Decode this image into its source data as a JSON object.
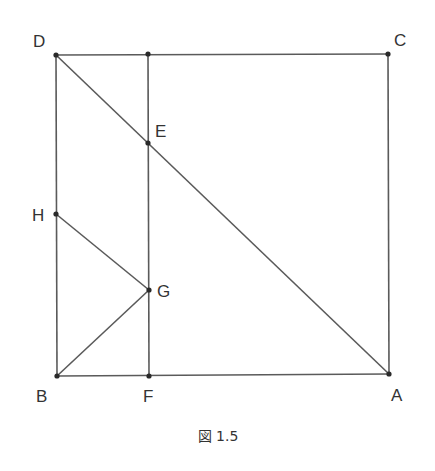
{
  "figure": {
    "caption": "図 1.5",
    "points": {
      "A": {
        "label": "A"
      },
      "B": {
        "label": "B"
      },
      "C": {
        "label": "C"
      },
      "D": {
        "label": "D"
      },
      "E": {
        "label": "E"
      },
      "F": {
        "label": "F"
      },
      "G": {
        "label": "G"
      },
      "H": {
        "label": "H"
      },
      "T": {
        "label": ""
      }
    },
    "segments": [
      [
        "D",
        "C"
      ],
      [
        "C",
        "A"
      ],
      [
        "A",
        "B"
      ],
      [
        "B",
        "D"
      ],
      [
        "D",
        "A"
      ],
      [
        "T",
        "F"
      ],
      [
        "H",
        "G"
      ],
      [
        "B",
        "G"
      ]
    ],
    "colors": {
      "line": "#5a5a5a",
      "point": "#2a2a2a",
      "text": "#333333"
    }
  }
}
